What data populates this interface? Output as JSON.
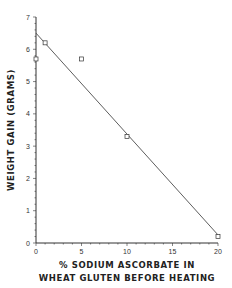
{
  "chart_data": {
    "type": "scatter",
    "title": "",
    "xlabel_line1": "% SODIUM ASCORBATE IN",
    "xlabel_line2": "WHEAT GLUTEN BEFORE HEATING",
    "ylabel": "WEIGHT   GAIN  (GRAMS)",
    "xlim": [
      0,
      20
    ],
    "ylim": [
      0,
      7
    ],
    "x_ticks": [
      0,
      5,
      10,
      15,
      20
    ],
    "y_ticks": [
      0,
      1,
      2,
      3,
      4,
      5,
      6,
      7
    ],
    "grid": false,
    "legend": null,
    "series": [
      {
        "name": "observed",
        "marker": "open-square",
        "points": [
          {
            "x": 0,
            "y": 5.7
          },
          {
            "x": 1,
            "y": 6.2
          },
          {
            "x": 5,
            "y": 5.7
          },
          {
            "x": 10,
            "y": 3.3
          },
          {
            "x": 20,
            "y": 0.2
          }
        ]
      },
      {
        "name": "fit",
        "type": "line",
        "points": [
          {
            "x": 0,
            "y": 6.5
          },
          {
            "x": 20,
            "y": 0.25
          }
        ]
      }
    ],
    "colors": {
      "ink": "#333333",
      "background": "#ffffff"
    }
  }
}
